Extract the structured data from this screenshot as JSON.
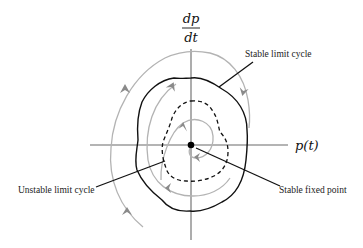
{
  "diagram": {
    "type": "phase-portrait",
    "axes": {
      "y_label_numerator": "dp",
      "y_label_denominator": "dt",
      "x_label": "p(t)"
    },
    "annotations": {
      "stable_limit_cycle": "Stable limit cycle",
      "unstable_limit_cycle": "Unstable limit cycle",
      "stable_fixed_point": "Stable fixed point"
    },
    "colors": {
      "axis": "#6a6a6a",
      "trajectory": "#b3b3b3",
      "limit_cycle": "#111111",
      "arrow": "#8a8a8a",
      "fixed_point": "#000000"
    }
  }
}
